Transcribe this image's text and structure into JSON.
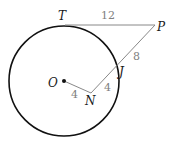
{
  "diagram": {
    "type": "geometry-circle-tangent-secant",
    "points": {
      "O": {
        "label": "O",
        "x": 64,
        "y": 81
      },
      "T": {
        "label": "T",
        "x": 65,
        "y": 25
      },
      "P": {
        "label": "P",
        "x": 155,
        "y": 25
      },
      "J": {
        "label": "J",
        "x": 116,
        "y": 68
      },
      "N": {
        "label": "N",
        "x": 91,
        "y": 93
      }
    },
    "circle": {
      "center": "O",
      "cx": 64,
      "cy": 81,
      "r": 55
    },
    "segments": [
      {
        "from": "T",
        "to": "P",
        "length_label": "12"
      },
      {
        "from": "P",
        "to": "J",
        "length_label": "8"
      },
      {
        "from": "J",
        "to": "N",
        "length_label": "4"
      },
      {
        "from": "O",
        "to": "N",
        "length_label": "4"
      }
    ],
    "colors": {
      "circle": "#111111",
      "segment": "#888888",
      "label": "#1a1a1a",
      "number": "#808080"
    }
  }
}
